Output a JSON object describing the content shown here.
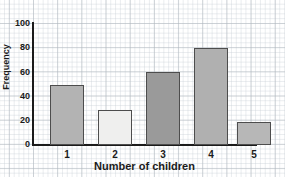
{
  "chart_data": {
    "type": "bar",
    "title": "",
    "xlabel": "Number of children",
    "ylabel": "Frequency",
    "categories": [
      "1",
      "2",
      "3",
      "4",
      "5"
    ],
    "values": [
      50,
      29,
      60,
      80,
      19
    ],
    "series": [
      {
        "name": "Frequency",
        "values": [
          50,
          29,
          60,
          80,
          19
        ]
      }
    ],
    "ylim": [
      0,
      100
    ],
    "yticks": [
      0,
      20,
      40,
      60,
      80,
      100
    ],
    "ytick_labels": [
      "0",
      "20",
      "40",
      "60",
      "80",
      "100"
    ],
    "xtick_labels": [
      "1",
      "2",
      "3",
      "4",
      "5"
    ],
    "grid": true,
    "grid_style": "graph-paper",
    "legend": false,
    "legend_position": "none",
    "bar_colors": [
      "#b3b3b3",
      "#efefee",
      "#9a9a9a",
      "#b0b0b0",
      "#b7b7b7"
    ],
    "bar_edge_color": "#4d4d4d",
    "axis_color": "#1b1b1b",
    "background_color": "#ffffff",
    "grid_minor_color": "#afb9c3",
    "grid_major_color": "#8c96a0"
  },
  "axes": {
    "y_title": "Frequency",
    "x_title": "Number of children"
  }
}
